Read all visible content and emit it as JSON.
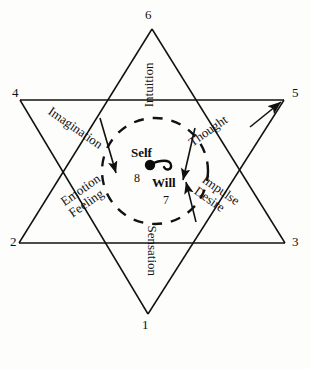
{
  "diagram": {
    "shape": "six-pointed-star",
    "stroke_color": "#111111",
    "background_color": "#fdfdfc",
    "vertices": [
      {
        "number": "1",
        "position": "bottom",
        "label": "Sensation"
      },
      {
        "number": "2",
        "position": "lower-left",
        "label": "Emotion Feeling"
      },
      {
        "number": "3",
        "position": "lower-right",
        "label": "Impulse Desire"
      },
      {
        "number": "4",
        "position": "upper-left",
        "label": "Imagination"
      },
      {
        "number": "5",
        "position": "upper-right",
        "label": "Thought"
      },
      {
        "number": "6",
        "position": "top",
        "label": "Intuition"
      }
    ],
    "ray_labels": {
      "intuition": "Intuition",
      "thought": "Thought",
      "impulse": "Impulse",
      "desire": "Desire",
      "sensation": "Sensation",
      "emotion": "Emotion",
      "feeling": "Feeling",
      "imagination": "Imagination"
    },
    "center": {
      "self_label": "Self",
      "self_number": "8",
      "will_label": "Will",
      "will_number": "7",
      "circle_style": "dashed",
      "dot": "filled-circle",
      "glyph": "spiral-hook"
    }
  }
}
